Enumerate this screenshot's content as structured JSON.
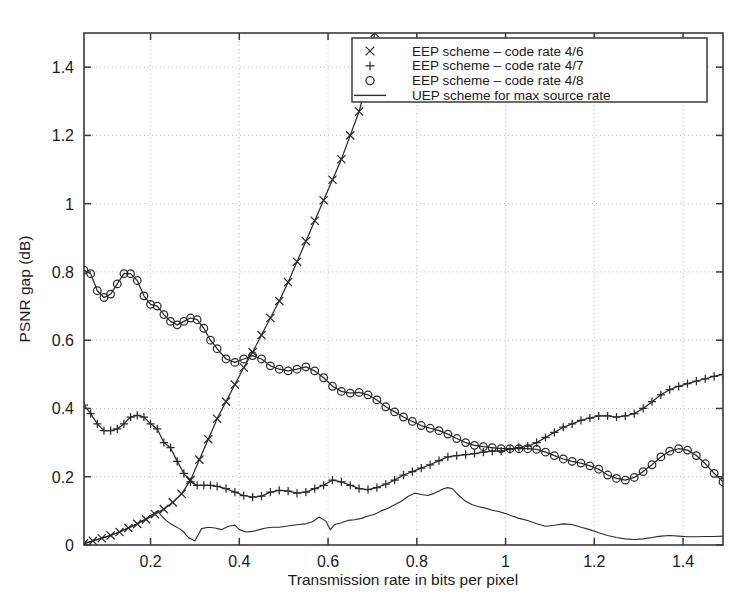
{
  "chart_data": {
    "type": "line",
    "title": "",
    "xlabel": "Transmission rate in bits per pixel",
    "ylabel": "PSNR gap (dB)",
    "xlim": [
      0.05,
      1.49
    ],
    "ylim": [
      0,
      1.5
    ],
    "xticks": [
      0.2,
      0.4,
      0.6,
      0.8,
      1,
      1.2,
      1.4
    ],
    "xtick_labels": [
      "0.2",
      "0.4",
      "0.6",
      "0.8",
      "1",
      "1.2",
      "1.4"
    ],
    "yticks": [
      0,
      0.2,
      0.4,
      0.6,
      0.8,
      1,
      1.2,
      1.4
    ],
    "ytick_labels": [
      "0",
      "0.2",
      "0.4",
      "0.6",
      "0.8",
      "1",
      "1.2",
      "1.4"
    ],
    "grid": true,
    "grid_style": "dotted",
    "legend_position": "top-right",
    "line_color": "#2b2b2b",
    "series": [
      {
        "name": "EEP scheme – code rate 4/6",
        "marker": "x",
        "note": "monotonically increasing, exits top of axes near x=0.70",
        "x": [
          0.05,
          0.07,
          0.09,
          0.11,
          0.13,
          0.15,
          0.17,
          0.19,
          0.21,
          0.23,
          0.25,
          0.27,
          0.29,
          0.31,
          0.33,
          0.35,
          0.37,
          0.39,
          0.41,
          0.43,
          0.45,
          0.47,
          0.49,
          0.51,
          0.53,
          0.55,
          0.57,
          0.59,
          0.61,
          0.63,
          0.65,
          0.67,
          0.69,
          0.705
        ],
        "y": [
          0.005,
          0.012,
          0.02,
          0.028,
          0.038,
          0.05,
          0.062,
          0.075,
          0.09,
          0.105,
          0.125,
          0.15,
          0.19,
          0.25,
          0.31,
          0.37,
          0.42,
          0.47,
          0.52,
          0.565,
          0.615,
          0.665,
          0.715,
          0.77,
          0.83,
          0.89,
          0.95,
          1.01,
          1.07,
          1.13,
          1.2,
          1.27,
          1.37,
          1.5
        ]
      },
      {
        "name": "EEP scheme – code rate 4/7",
        "marker": "+",
        "note": "starts 0.41, dips, flat plateau ~0.17, then rises to 0.50",
        "x": [
          0.05,
          0.065,
          0.08,
          0.095,
          0.11,
          0.125,
          0.14,
          0.155,
          0.17,
          0.185,
          0.2,
          0.215,
          0.23,
          0.245,
          0.26,
          0.275,
          0.29,
          0.305,
          0.32,
          0.335,
          0.35,
          0.37,
          0.39,
          0.41,
          0.43,
          0.45,
          0.47,
          0.49,
          0.51,
          0.53,
          0.55,
          0.57,
          0.59,
          0.61,
          0.63,
          0.65,
          0.67,
          0.69,
          0.71,
          0.73,
          0.75,
          0.77,
          0.79,
          0.81,
          0.83,
          0.85,
          0.87,
          0.89,
          0.91,
          0.93,
          0.95,
          0.97,
          0.99,
          1.01,
          1.03,
          1.05,
          1.07,
          1.09,
          1.11,
          1.13,
          1.15,
          1.17,
          1.19,
          1.21,
          1.23,
          1.25,
          1.27,
          1.29,
          1.31,
          1.33,
          1.35,
          1.37,
          1.39,
          1.41,
          1.43,
          1.45,
          1.47,
          1.49
        ],
        "y": [
          0.41,
          0.385,
          0.355,
          0.335,
          0.335,
          0.34,
          0.355,
          0.375,
          0.38,
          0.375,
          0.355,
          0.34,
          0.3,
          0.285,
          0.245,
          0.21,
          0.185,
          0.175,
          0.175,
          0.175,
          0.172,
          0.165,
          0.155,
          0.145,
          0.14,
          0.143,
          0.155,
          0.16,
          0.158,
          0.152,
          0.155,
          0.165,
          0.175,
          0.19,
          0.185,
          0.175,
          0.165,
          0.162,
          0.168,
          0.178,
          0.19,
          0.205,
          0.215,
          0.225,
          0.235,
          0.247,
          0.258,
          0.262,
          0.265,
          0.268,
          0.272,
          0.275,
          0.275,
          0.28,
          0.285,
          0.29,
          0.3,
          0.315,
          0.33,
          0.345,
          0.355,
          0.365,
          0.372,
          0.378,
          0.378,
          0.375,
          0.378,
          0.385,
          0.4,
          0.42,
          0.44,
          0.455,
          0.465,
          0.473,
          0.48,
          0.487,
          0.494,
          0.5
        ]
      },
      {
        "name": "EEP scheme – code rate 4/8",
        "marker": "o",
        "note": "starts 0.80, wavy decline to 0.18 at right",
        "x": [
          0.05,
          0.065,
          0.08,
          0.095,
          0.11,
          0.125,
          0.14,
          0.155,
          0.17,
          0.185,
          0.2,
          0.215,
          0.23,
          0.245,
          0.26,
          0.275,
          0.29,
          0.305,
          0.32,
          0.335,
          0.35,
          0.37,
          0.39,
          0.41,
          0.43,
          0.45,
          0.47,
          0.49,
          0.51,
          0.53,
          0.55,
          0.57,
          0.59,
          0.61,
          0.63,
          0.65,
          0.67,
          0.69,
          0.71,
          0.73,
          0.75,
          0.77,
          0.79,
          0.81,
          0.83,
          0.85,
          0.87,
          0.89,
          0.91,
          0.93,
          0.95,
          0.97,
          0.99,
          1.01,
          1.03,
          1.05,
          1.07,
          1.09,
          1.11,
          1.13,
          1.15,
          1.17,
          1.19,
          1.21,
          1.23,
          1.25,
          1.27,
          1.29,
          1.31,
          1.33,
          1.35,
          1.37,
          1.39,
          1.41,
          1.43,
          1.45,
          1.47,
          1.49
        ],
        "y": [
          0.805,
          0.795,
          0.745,
          0.725,
          0.735,
          0.765,
          0.795,
          0.795,
          0.775,
          0.73,
          0.705,
          0.7,
          0.675,
          0.655,
          0.645,
          0.655,
          0.665,
          0.66,
          0.635,
          0.6,
          0.575,
          0.545,
          0.535,
          0.545,
          0.555,
          0.545,
          0.525,
          0.515,
          0.51,
          0.515,
          0.522,
          0.51,
          0.49,
          0.465,
          0.45,
          0.445,
          0.447,
          0.44,
          0.425,
          0.405,
          0.39,
          0.375,
          0.362,
          0.35,
          0.342,
          0.335,
          0.325,
          0.312,
          0.3,
          0.292,
          0.288,
          0.285,
          0.282,
          0.282,
          0.282,
          0.282,
          0.28,
          0.272,
          0.262,
          0.252,
          0.245,
          0.24,
          0.232,
          0.222,
          0.205,
          0.195,
          0.19,
          0.198,
          0.215,
          0.235,
          0.258,
          0.275,
          0.282,
          0.278,
          0.262,
          0.238,
          0.21,
          0.185
        ]
      },
      {
        "name": "UEP scheme for max source rate",
        "marker": "line",
        "note": "solid thin line, near zero, hump ~0.17 near x=0.87",
        "x": [
          0.05,
          0.07,
          0.09,
          0.11,
          0.13,
          0.15,
          0.17,
          0.19,
          0.205,
          0.215,
          0.225,
          0.235,
          0.245,
          0.255,
          0.265,
          0.275,
          0.285,
          0.3,
          0.315,
          0.33,
          0.345,
          0.36,
          0.375,
          0.39,
          0.4,
          0.415,
          0.43,
          0.445,
          0.46,
          0.475,
          0.49,
          0.505,
          0.52,
          0.535,
          0.55,
          0.565,
          0.58,
          0.595,
          0.605,
          0.615,
          0.63,
          0.645,
          0.66,
          0.675,
          0.69,
          0.705,
          0.72,
          0.735,
          0.75,
          0.765,
          0.78,
          0.795,
          0.81,
          0.825,
          0.84,
          0.85,
          0.86,
          0.87,
          0.88,
          0.895,
          0.91,
          0.925,
          0.94,
          0.955,
          0.97,
          0.985,
          1.0,
          1.015,
          1.03,
          1.05,
          1.07,
          1.09,
          1.11,
          1.13,
          1.15,
          1.17,
          1.19,
          1.21,
          1.23,
          1.25,
          1.27,
          1.29,
          1.31,
          1.33,
          1.35,
          1.37,
          1.39,
          1.41,
          1.43,
          1.45,
          1.47,
          1.49
        ],
        "y": [
          0.003,
          0.012,
          0.02,
          0.028,
          0.038,
          0.05,
          0.062,
          0.078,
          0.09,
          0.1,
          0.085,
          0.072,
          0.062,
          0.055,
          0.048,
          0.038,
          0.022,
          0.012,
          0.048,
          0.052,
          0.05,
          0.045,
          0.055,
          0.058,
          0.045,
          0.038,
          0.04,
          0.045,
          0.05,
          0.052,
          0.052,
          0.055,
          0.058,
          0.06,
          0.062,
          0.068,
          0.082,
          0.07,
          0.045,
          0.06,
          0.065,
          0.072,
          0.074,
          0.078,
          0.085,
          0.09,
          0.1,
          0.108,
          0.118,
          0.128,
          0.142,
          0.152,
          0.148,
          0.145,
          0.152,
          0.158,
          0.165,
          0.168,
          0.165,
          0.145,
          0.128,
          0.118,
          0.112,
          0.108,
          0.102,
          0.098,
          0.092,
          0.085,
          0.078,
          0.072,
          0.062,
          0.055,
          0.058,
          0.062,
          0.06,
          0.052,
          0.045,
          0.036,
          0.028,
          0.022,
          0.018,
          0.016,
          0.018,
          0.022,
          0.026,
          0.028,
          0.026,
          0.024,
          0.024,
          0.025,
          0.025,
          0.026
        ]
      }
    ]
  },
  "legend": {
    "entries": [
      {
        "marker": "x",
        "label": "EEP scheme – code rate 4/6"
      },
      {
        "marker": "+",
        "label": "EEP scheme – code rate 4/7"
      },
      {
        "marker": "o",
        "label": "EEP scheme – code rate 4/8"
      },
      {
        "marker": "line",
        "label": "UEP scheme for max source rate"
      }
    ]
  }
}
